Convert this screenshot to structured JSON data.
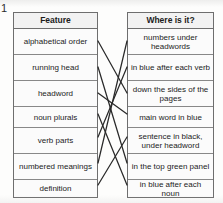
{
  "exercise": {
    "number": "1"
  },
  "left_table": {
    "header": "Feature",
    "rows": [
      "alphabetical order",
      "running head",
      "headword",
      "noun plurals",
      "verb parts",
      "numbered meanings",
      "definition"
    ]
  },
  "right_table": {
    "header": "Where is it?",
    "rows": [
      "numbers under headwords",
      "in blue after each verb",
      "down the sides of the pages",
      "main word in blue",
      "sentence in black, under headword",
      "in the top green panel",
      "in blue after each noun"
    ]
  },
  "connections": [
    {
      "from": "alphabetical order",
      "to": "down the sides of the pages",
      "from_index": 0,
      "to_index": 2
    },
    {
      "from": "running head",
      "to": "in the top green panel",
      "from_index": 1,
      "to_index": 5
    },
    {
      "from": "headword",
      "to": "main word in blue",
      "from_index": 2,
      "to_index": 3
    },
    {
      "from": "noun plurals",
      "to": "in blue after each noun",
      "from_index": 3,
      "to_index": 6
    },
    {
      "from": "verb parts",
      "to": "in blue after each verb",
      "from_index": 4,
      "to_index": 1
    },
    {
      "from": "numbered meanings",
      "to": "numbers under headwords",
      "from_index": 5,
      "to_index": 0
    },
    {
      "from": "definition",
      "to": "sentence in black, under headword",
      "from_index": 6,
      "to_index": 4
    }
  ],
  "geometry": {
    "left_edge_x": 98,
    "right_edge_x": 127,
    "left_row_centers_y": [
      41,
      67,
      93,
      114,
      137,
      163,
      185
    ],
    "right_row_centers_y": [
      41,
      67,
      93,
      114,
      137,
      163,
      185
    ]
  },
  "colors": {
    "line": "#2a2a2a",
    "border": "#6e6e6e",
    "inner_border": "#888888",
    "header_bg": "#f2f2f2",
    "cell_bg": "#fbfbfb",
    "text": "#1c1c1c"
  }
}
